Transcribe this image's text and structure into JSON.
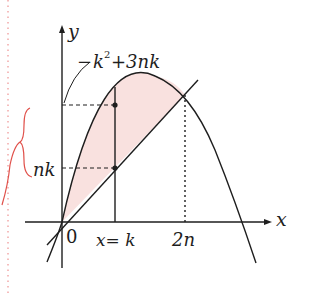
{
  "diagram": {
    "labels": {
      "y_axis": "y",
      "x_axis": "x",
      "origin": "0",
      "top_value_minus": "−",
      "top_value_k": "k",
      "top_value_exp": "2",
      "top_value_rest": "+3nk",
      "mid_value": "nk",
      "vertical_line": "x= k",
      "intersection_x": "2n"
    },
    "curves": [
      {
        "name": "parabola",
        "equation": "y = -x^2 + 3nx"
      },
      {
        "name": "line",
        "equation": "y = nx"
      }
    ],
    "points": [
      {
        "name": "parabola-at-k",
        "x": "k",
        "y": "-k^2+3nk"
      },
      {
        "name": "line-at-k",
        "x": "k",
        "y": "nk"
      },
      {
        "name": "intersection",
        "x": "2n",
        "y": "2n^2"
      }
    ],
    "colors": {
      "stroke": "#1e1e1e",
      "fill": "#f9e1df",
      "annotation": "#e0504a",
      "margin_dots": "#f2a8a8"
    }
  }
}
